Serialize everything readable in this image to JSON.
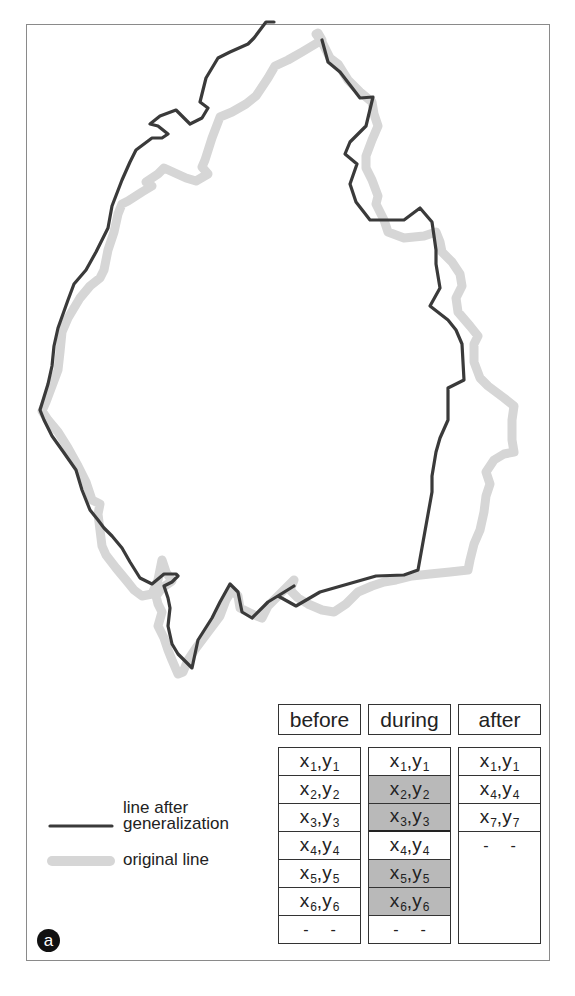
{
  "figure": {
    "panel_label": "a",
    "colors": {
      "generalized_line": "#3a3a3a",
      "original_line": "#d6d6d6",
      "highlight_cell": "#b9b9b9",
      "frame": "#8a8a8a"
    }
  },
  "legend": {
    "generalized": {
      "label_line1": "line after",
      "label_line2": "generalization",
      "icon": "dark-line-swatch"
    },
    "original": {
      "label": "original line",
      "icon": "light-thick-line-swatch"
    }
  },
  "table": {
    "columns": [
      {
        "header": "before",
        "rows": [
          {
            "x": "x",
            "xs": "1",
            "y": "y",
            "ys": "1",
            "highlight": false
          },
          {
            "x": "x",
            "xs": "2",
            "y": "y",
            "ys": "2",
            "highlight": false
          },
          {
            "x": "x",
            "xs": "3",
            "y": "y",
            "ys": "3",
            "highlight": false
          },
          {
            "x": "x",
            "xs": "4",
            "y": "y",
            "ys": "4",
            "highlight": false
          },
          {
            "x": "x",
            "xs": "5",
            "y": "y",
            "ys": "5",
            "highlight": false
          },
          {
            "x": "x",
            "xs": "6",
            "y": "y",
            "ys": "6",
            "highlight": false
          }
        ],
        "ellipsis": "- -"
      },
      {
        "header": "during",
        "rows": [
          {
            "x": "x",
            "xs": "1",
            "y": "y",
            "ys": "1",
            "highlight": false
          },
          {
            "x": "x",
            "xs": "2",
            "y": "y",
            "ys": "2",
            "highlight": true
          },
          {
            "x": "x",
            "xs": "3",
            "y": "y",
            "ys": "3",
            "highlight": true
          },
          {
            "x": "x",
            "xs": "4",
            "y": "y",
            "ys": "4",
            "highlight": false
          },
          {
            "x": "x",
            "xs": "5",
            "y": "y",
            "ys": "5",
            "highlight": true
          },
          {
            "x": "x",
            "xs": "6",
            "y": "y",
            "ys": "6",
            "highlight": true
          }
        ],
        "ellipsis": "- -"
      },
      {
        "header": "after",
        "rows": [
          {
            "x": "x",
            "xs": "1",
            "y": "y",
            "ys": "1",
            "highlight": false
          },
          {
            "x": "x",
            "xs": "4",
            "y": "y",
            "ys": "4",
            "highlight": false
          },
          {
            "x": "x",
            "xs": "7",
            "y": "y",
            "ys": "7",
            "highlight": false
          }
        ],
        "ellipsis": "- -"
      }
    ]
  }
}
